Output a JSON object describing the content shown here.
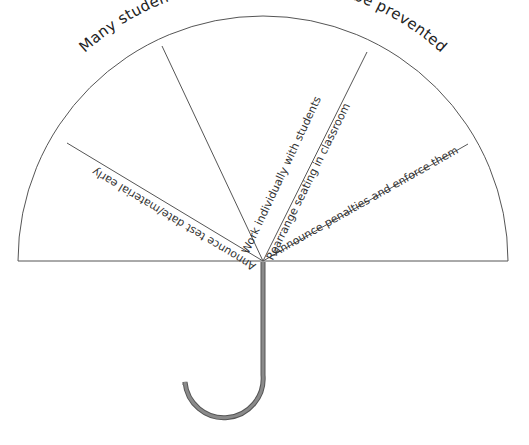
{
  "diagram": {
    "type": "umbrella",
    "title": "Many students believe cheating can be prevented",
    "segments": [
      {
        "label": "Announce test date/material early"
      },
      {
        "label": "Work individually with students"
      },
      {
        "label": "Rearrange seating in classroom"
      },
      {
        "label": "Announce penalties and enforce them"
      }
    ],
    "colors": {
      "line": "#555555",
      "handle_fill": "#888888",
      "handle_stroke": "#555555",
      "text": "#333333"
    }
  }
}
